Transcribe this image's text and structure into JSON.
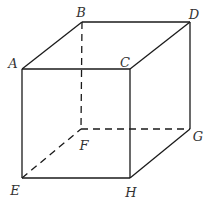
{
  "diagram": {
    "type": "cube",
    "stroke_color": "#1a1a1a",
    "label_color": "#333333",
    "vertices": {
      "A": [
        22,
        69
      ],
      "B": [
        82,
        22
      ],
      "C": [
        130,
        69
      ],
      "D": [
        190,
        22
      ],
      "E": [
        22,
        178
      ],
      "F": [
        81,
        129
      ],
      "G": [
        190,
        129
      ],
      "H": [
        130,
        178
      ]
    },
    "labels": [
      {
        "id": "A",
        "text": "A",
        "x": 13,
        "y": 63
      },
      {
        "id": "B",
        "text": "B",
        "x": 81,
        "y": 12
      },
      {
        "id": "C",
        "text": "C",
        "x": 125,
        "y": 62
      },
      {
        "id": "D",
        "text": "D",
        "x": 194,
        "y": 14
      },
      {
        "id": "E",
        "text": "E",
        "x": 15,
        "y": 190
      },
      {
        "id": "F",
        "text": "F",
        "x": 84,
        "y": 145
      },
      {
        "id": "G",
        "text": "G",
        "x": 198,
        "y": 136
      },
      {
        "id": "H",
        "text": "H",
        "x": 131,
        "y": 192
      }
    ],
    "visible_edges": [
      [
        "A",
        "B"
      ],
      [
        "B",
        "D"
      ],
      [
        "A",
        "C"
      ],
      [
        "C",
        "D"
      ],
      [
        "A",
        "E"
      ],
      [
        "C",
        "H"
      ],
      [
        "D",
        "G"
      ],
      [
        "E",
        "H"
      ],
      [
        "H",
        "G"
      ]
    ],
    "hidden_edges": [
      [
        "B",
        "F"
      ],
      [
        "F",
        "G"
      ],
      [
        "E",
        "F"
      ]
    ]
  }
}
